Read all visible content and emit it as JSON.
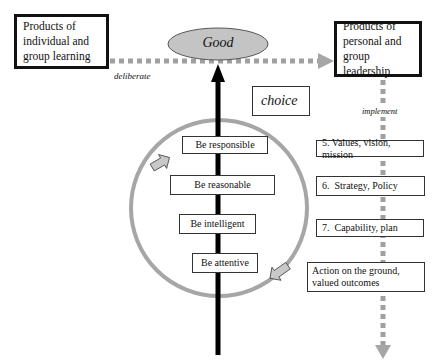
{
  "diagram": {
    "left_box": {
      "label": "Products of individual and group learning"
    },
    "right_box": {
      "label": "Products of personal and group leadership"
    },
    "center_ellipse": {
      "label": "Good"
    },
    "horizontal_arrow": {
      "label": "deliberate"
    },
    "choice_box": {
      "label": "choice"
    },
    "vertical_flow": {
      "label": "implement"
    },
    "cycle_steps": [
      {
        "label": "Be responsible"
      },
      {
        "label": "Be reasonable"
      },
      {
        "label": "Be intelligent"
      },
      {
        "label": "Be attentive"
      }
    ],
    "implementation_steps": [
      {
        "label": "5. Values, vision, mission"
      },
      {
        "label": "6.  Strategy, Policy"
      },
      {
        "label": "7.  Capability, plan"
      },
      {
        "label": "Action on the ground, valued outcomes"
      }
    ],
    "colors": {
      "dotted_line": "#a0a0a0",
      "circle": "#a6a6a6",
      "ellipse_fill": "#c4c4c4",
      "arrow_black": "#000000",
      "cycle_arrow_fill": "#c8c8c8"
    }
  }
}
